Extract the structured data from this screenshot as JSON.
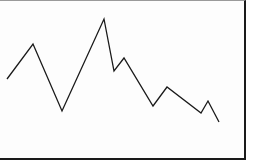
{
  "chart_data": {
    "type": "line",
    "title": "",
    "xlabel": "",
    "ylabel": "",
    "grid": false,
    "legend": null,
    "x": [
      0,
      1,
      2,
      3,
      4,
      5,
      6,
      7,
      8,
      9,
      10
    ],
    "series": [
      {
        "name": "",
        "color": "#1a1a1a",
        "values": [
          48,
          72,
          28,
          88,
          52,
          62,
          31,
          43,
          27,
          34,
          20
        ],
        "pixel_points": [
          [
            7,
            79
          ],
          [
            33,
            44
          ],
          [
            62,
            111
          ],
          [
            104,
            19
          ],
          [
            114,
            71
          ],
          [
            124,
            58
          ],
          [
            153,
            106
          ],
          [
            167,
            87
          ],
          [
            201,
            113
          ],
          [
            208,
            101
          ],
          [
            219,
            122
          ]
        ]
      }
    ],
    "ylim": [
      0,
      100
    ]
  }
}
